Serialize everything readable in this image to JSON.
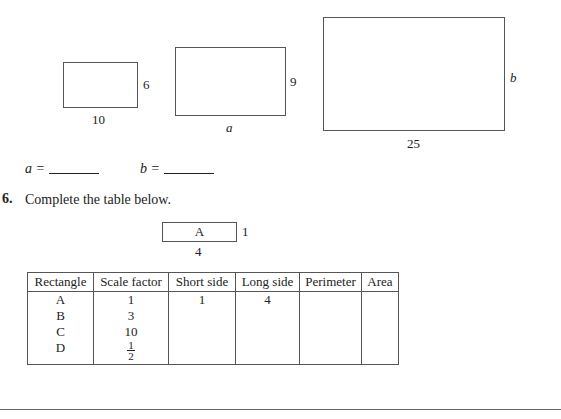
{
  "figures": {
    "rect_small": {
      "bottom_label": "10",
      "side_label": "6"
    },
    "rect_medium": {
      "bottom_label": "a",
      "side_label": "9"
    },
    "rect_large": {
      "bottom_label": "25",
      "side_label": "b"
    }
  },
  "answers": {
    "a_label": "a =",
    "b_label": "b ="
  },
  "question": {
    "number": "6.",
    "text": "Complete the table below."
  },
  "rect_a": {
    "name": "A",
    "side_label": "1",
    "bottom_label": "4"
  },
  "table": {
    "headers": [
      "Rectangle",
      "Scale factor",
      "Short side",
      "Long side",
      "Perimeter",
      "Area"
    ],
    "rows": [
      {
        "rectangle": "A",
        "scale": "1",
        "short": "1",
        "long": "4",
        "perimeter": "",
        "area": ""
      },
      {
        "rectangle": "B",
        "scale": "3",
        "short": "",
        "long": "",
        "perimeter": "",
        "area": ""
      },
      {
        "rectangle": "C",
        "scale": "10",
        "short": "",
        "long": "",
        "perimeter": "",
        "area": ""
      },
      {
        "rectangle": "D",
        "scale_num": "1",
        "scale_den": "2",
        "short": "",
        "long": "",
        "perimeter": "",
        "area": ""
      }
    ]
  }
}
